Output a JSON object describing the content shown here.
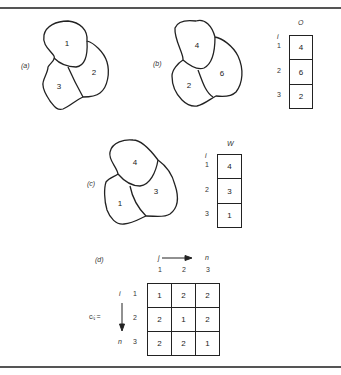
{
  "figures": {
    "a": {
      "label": "(a)",
      "regions": [
        {
          "id": "1",
          "label": "1"
        },
        {
          "id": "2",
          "label": "2"
        },
        {
          "id": "3",
          "label": "3"
        }
      ]
    },
    "b": {
      "label": "(b)",
      "regions": [
        {
          "id": "r1",
          "label": "4"
        },
        {
          "id": "r2",
          "label": "6"
        },
        {
          "id": "r3",
          "label": "2"
        }
      ],
      "table": {
        "title": "O",
        "index_label": "i",
        "rows": [
          {
            "i": "1",
            "value": "4"
          },
          {
            "i": "2",
            "value": "6"
          },
          {
            "i": "3",
            "value": "2"
          }
        ]
      }
    },
    "c": {
      "label": "(c)",
      "regions": [
        {
          "id": "r4",
          "label": "4"
        },
        {
          "id": "r3",
          "label": "3"
        },
        {
          "id": "r1",
          "label": "1"
        }
      ],
      "table": {
        "title": "W",
        "index_label": "i",
        "rows": [
          {
            "i": "1",
            "value": "4"
          },
          {
            "i": "2",
            "value": "3"
          },
          {
            "i": "3",
            "value": "1"
          }
        ]
      }
    },
    "d": {
      "label": "(d)",
      "col_index_label": "j",
      "col_end_label": "n",
      "row_index_label": "i",
      "row_end_label": "n",
      "matrix_label": "cᵢⱼ =",
      "col_headers": [
        "1",
        "2",
        "3"
      ],
      "row_headers": [
        "1",
        "2",
        "3"
      ],
      "matrix": [
        [
          "1",
          "2",
          "2"
        ],
        [
          "2",
          "1",
          "2"
        ],
        [
          "2",
          "2",
          "1"
        ]
      ]
    }
  }
}
